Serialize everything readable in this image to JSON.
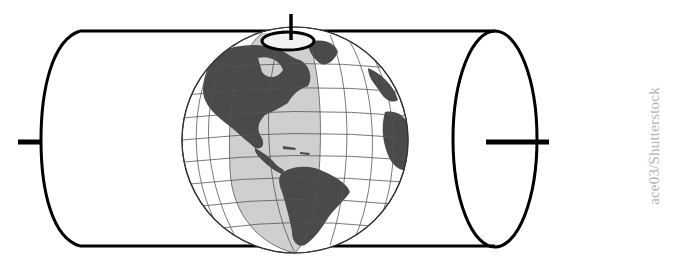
{
  "diagram": {
    "elements": {
      "cylinder": {
        "orientation": "horizontal",
        "stroke": "#000000",
        "fill": "#ffffff"
      },
      "globe": {
        "continents_shown": [
          "North America",
          "South America",
          "Greenland",
          "Western Europe",
          "Western Africa"
        ],
        "land_color": "#4a4a4a",
        "ocean_color": "#ffffff",
        "graticule_color": "#555555"
      },
      "tangent_meridian_band": {
        "fill": "#cfcfcf"
      },
      "pole_marker": {
        "position": "top"
      },
      "axis_ticks": [
        "left",
        "right",
        "top"
      ]
    }
  },
  "credit": "ace03/Shutterstock",
  "colors": {
    "line": "#000000",
    "band": "#cfcfcf",
    "land": "#4a4a4a",
    "credit_text": "#b4b4b4"
  }
}
